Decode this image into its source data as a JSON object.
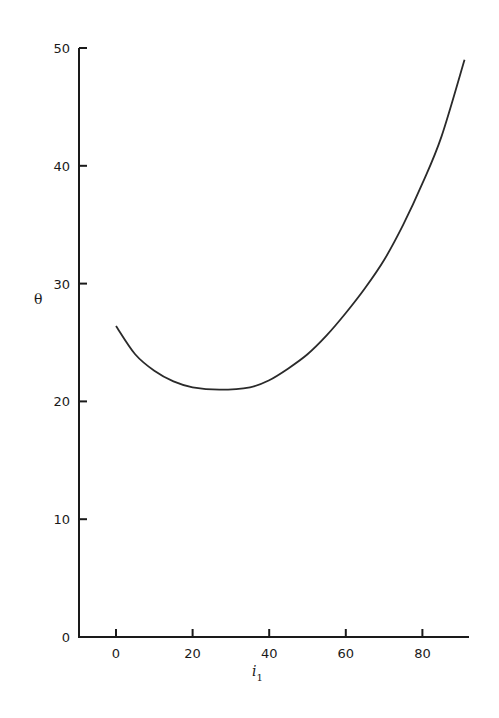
{
  "chart_data": {
    "type": "line",
    "title": "",
    "xlabel": "i",
    "xlabel_subscript": "1",
    "ylabel": "θ",
    "xlim": [
      -10,
      92
    ],
    "ylim": [
      0,
      50
    ],
    "grid": false,
    "legend": null,
    "x_ticks": [
      0,
      20,
      40,
      60,
      80
    ],
    "y_ticks": [
      0,
      10,
      20,
      30,
      40,
      50
    ],
    "x_tick_labels": [
      "0",
      "20",
      "40",
      "60",
      "80"
    ],
    "y_tick_labels": [
      "0",
      "10",
      "20",
      "30",
      "40",
      "50"
    ],
    "series": [
      {
        "name": "θ vs i1",
        "x": [
          0,
          5,
          10,
          15,
          20,
          27,
          35,
          40,
          45,
          50,
          55,
          60,
          65,
          70,
          75,
          80,
          85,
          91
        ],
        "y": [
          26.4,
          24.0,
          22.6,
          21.7,
          21.2,
          21.0,
          21.2,
          21.8,
          22.8,
          24.0,
          25.6,
          27.5,
          29.6,
          32.0,
          35.0,
          38.5,
          42.5,
          49.0
        ]
      }
    ]
  },
  "colors": {
    "line": "#2a2a2a",
    "axis": "#1a1a1a",
    "background": "#ffffff"
  }
}
